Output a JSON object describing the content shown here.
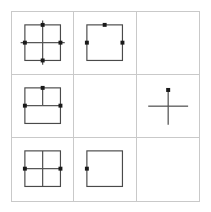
{
  "puzzle": {
    "type": "visual-reasoning-matrix",
    "rows": 3,
    "columns": 3,
    "background_color": "#ffffff",
    "grid_line_color": "#c9c9c9",
    "figure_stroke_color": "#4a4a4a",
    "dot_color": "#1a1a1a",
    "cells": [
      {
        "id": "cell-r1c1",
        "position": "row1-col1",
        "description": "square with full cross and four edge dots",
        "has_square": true,
        "has_cross": true,
        "cross_extends_beyond_square": true,
        "cross_arms": [
          "up",
          "down",
          "left",
          "right"
        ],
        "dots": [
          "top",
          "right",
          "bottom",
          "left"
        ],
        "dot_count": 4
      },
      {
        "id": "cell-r1c2",
        "position": "row1-col2",
        "description": "square with three edge dots and no cross",
        "has_square": true,
        "has_cross": false,
        "cross_extends_beyond_square": false,
        "cross_arms": [],
        "dots": [
          "top",
          "right",
          "left"
        ],
        "dot_count": 3
      },
      {
        "id": "cell-r1c3",
        "position": "row1-col3",
        "description": "empty cell",
        "has_square": false,
        "has_cross": false,
        "cross_extends_beyond_square": false,
        "cross_arms": [],
        "dots": [],
        "dot_count": 0
      },
      {
        "id": "cell-r2c1",
        "position": "row2-col1",
        "description": "square with cross and three edge dots",
        "has_square": true,
        "has_cross": true,
        "cross_extends_beyond_square": false,
        "cross_arms": [
          "up",
          "left",
          "right"
        ],
        "dots": [
          "top",
          "right",
          "left"
        ],
        "dot_count": 3
      },
      {
        "id": "cell-r2c2",
        "position": "row2-col2",
        "description": "empty cell",
        "has_square": false,
        "has_cross": false,
        "cross_extends_beyond_square": false,
        "cross_arms": [],
        "dots": [],
        "dot_count": 0
      },
      {
        "id": "cell-r2c3",
        "position": "row2-col3",
        "description": "standalone cross with one dot at top of vertical arm",
        "has_square": false,
        "has_cross": true,
        "cross_extends_beyond_square": false,
        "cross_arms": [
          "up",
          "down",
          "left",
          "right"
        ],
        "dots": [
          "top"
        ],
        "dot_count": 1
      },
      {
        "id": "cell-r3c1",
        "position": "row3-col1",
        "description": "square with full cross and two side dots",
        "has_square": true,
        "has_cross": true,
        "cross_extends_beyond_square": false,
        "cross_arms": [
          "up",
          "down",
          "left",
          "right"
        ],
        "dots": [
          "right",
          "left"
        ],
        "dot_count": 2
      },
      {
        "id": "cell-r3c2",
        "position": "row3-col2",
        "description": "square with a single left edge dot",
        "has_square": true,
        "has_cross": false,
        "cross_extends_beyond_square": false,
        "cross_arms": [],
        "dots": [
          "left"
        ],
        "dot_count": 1
      },
      {
        "id": "cell-r3c3",
        "position": "row3-col3",
        "description": "empty cell",
        "has_square": false,
        "has_cross": false,
        "cross_extends_beyond_square": false,
        "cross_arms": [],
        "dots": [],
        "dot_count": 0
      }
    ]
  }
}
